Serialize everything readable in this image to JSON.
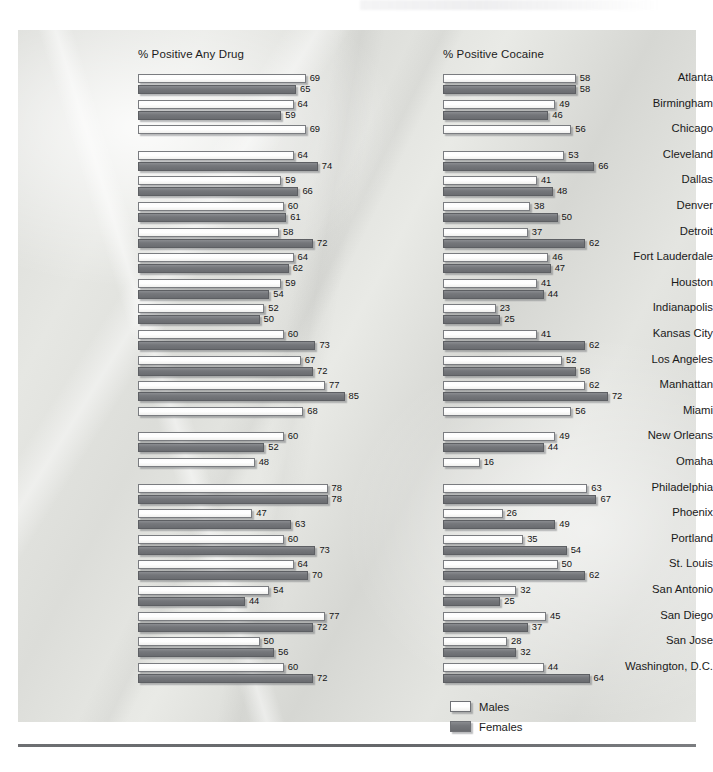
{
  "legend": {
    "male_label": "Males",
    "female_label": "Females"
  },
  "colors": {
    "male_bar": "#ffffff",
    "female_bar": "#75777b",
    "bar_outline": "#6f7175",
    "text": "#1a1a1a",
    "page_background": "#e0e1dd",
    "bottom_rule": "#6d6f72"
  },
  "chart_data": [
    {
      "type": "bar",
      "orientation": "horizontal",
      "title": "% Positive Any Drug",
      "xlabel": "",
      "ylabel": "",
      "xlim": [
        0,
        85
      ],
      "grid": false,
      "legend_position": "bottom-right",
      "categories": [
        "Atlanta",
        "Birmingham",
        "Chicago",
        "Cleveland",
        "Dallas",
        "Denver",
        "Detroit",
        "Fort Lauderdale",
        "Houston",
        "Indianapolis",
        "Kansas City",
        "Los Angeles",
        "Manhattan",
        "Miami",
        "New Orleans",
        "Omaha",
        "Philadelphia",
        "Phoenix",
        "Portland",
        "St. Louis",
        "San Antonio",
        "San Diego",
        "San Jose",
        "Washington, D.C."
      ],
      "series": [
        {
          "name": "Males",
          "values": [
            69,
            64,
            69,
            64,
            59,
            60,
            58,
            64,
            59,
            52,
            60,
            67,
            77,
            68,
            60,
            48,
            78,
            47,
            60,
            64,
            54,
            77,
            50,
            60
          ]
        },
        {
          "name": "Females",
          "values": [
            65,
            59,
            null,
            74,
            66,
            61,
            72,
            62,
            54,
            50,
            73,
            72,
            85,
            null,
            52,
            null,
            78,
            63,
            73,
            70,
            44,
            72,
            56,
            72
          ]
        }
      ]
    },
    {
      "type": "bar",
      "orientation": "horizontal",
      "title": "% Positive Cocaine",
      "xlabel": "",
      "ylabel": "",
      "xlim": [
        0,
        72
      ],
      "grid": false,
      "legend_position": "bottom-right",
      "categories": [
        "Atlanta",
        "Birmingham",
        "Chicago",
        "Cleveland",
        "Dallas",
        "Denver",
        "Detroit",
        "Fort Lauderdale",
        "Houston",
        "Indianapolis",
        "Kansas City",
        "Los Angeles",
        "Manhattan",
        "Miami",
        "New Orleans",
        "Omaha",
        "Philadelphia",
        "Phoenix",
        "Portland",
        "St. Louis",
        "San Antonio",
        "San Diego",
        "San Jose",
        "Washington, D.C."
      ],
      "series": [
        {
          "name": "Males",
          "values": [
            58,
            49,
            56,
            53,
            41,
            38,
            37,
            46,
            41,
            23,
            41,
            52,
            62,
            56,
            49,
            16,
            63,
            26,
            35,
            50,
            32,
            45,
            28,
            44
          ]
        },
        {
          "name": "Females",
          "values": [
            58,
            46,
            null,
            66,
            48,
            50,
            62,
            47,
            44,
            25,
            62,
            58,
            72,
            null,
            44,
            null,
            67,
            49,
            54,
            62,
            25,
            37,
            32,
            64
          ]
        }
      ]
    }
  ]
}
